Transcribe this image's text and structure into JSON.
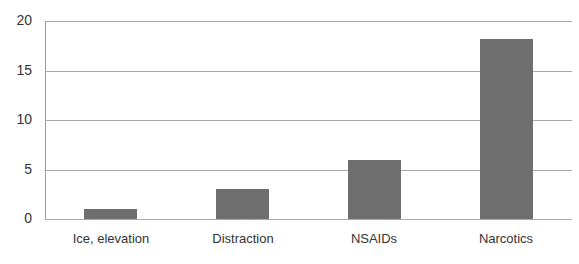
{
  "chart_data": {
    "type": "bar",
    "title": "",
    "xlabel": "",
    "ylabel": "",
    "categories": [
      "Ice, elevation",
      "Distraction",
      "NSAIDs",
      "Narcotics"
    ],
    "values": [
      1,
      3,
      6,
      18.2
    ],
    "ylim": [
      0,
      20
    ],
    "yticks": [
      0,
      5,
      10,
      15,
      20
    ],
    "grid": true,
    "legend": null,
    "bar_color": "#6e6e6e"
  }
}
